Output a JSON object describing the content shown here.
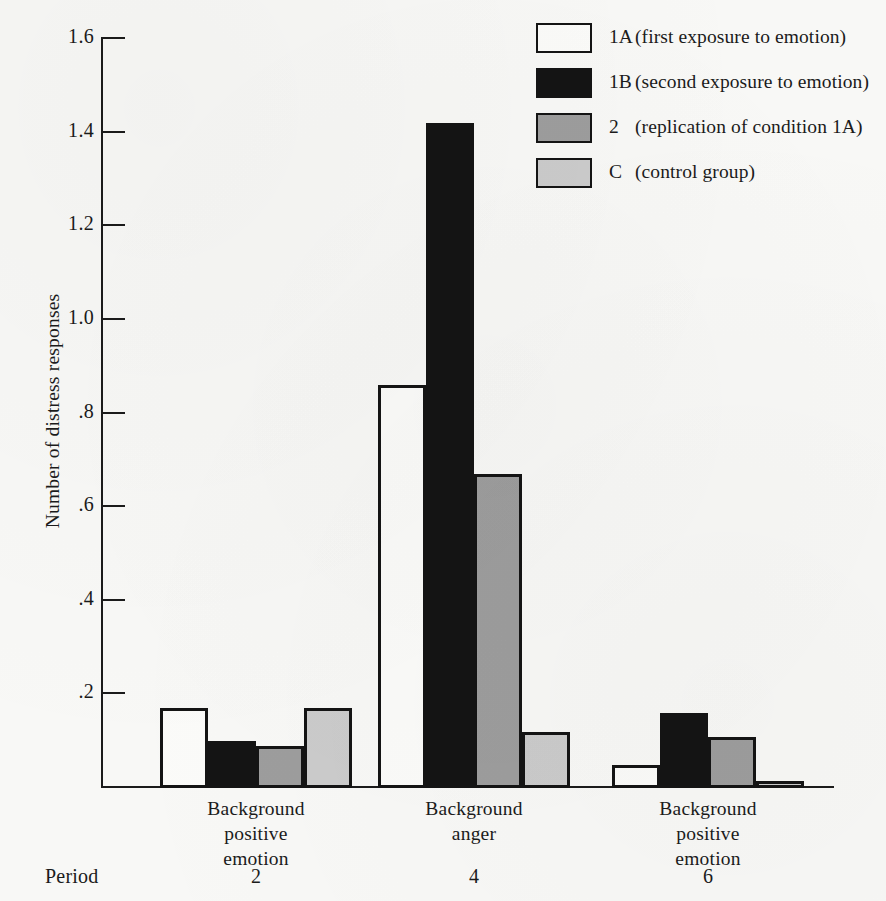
{
  "chart_data": {
    "type": "bar",
    "title": "",
    "xlabel": "",
    "ylabel": "Number of distress responses",
    "ylim": [
      0,
      1.6
    ],
    "ytick_labels": [
      "1.6",
      "1.4",
      "1.2",
      "1.0",
      ".8",
      ".6",
      ".4",
      ".2"
    ],
    "ytick_values": [
      1.6,
      1.4,
      1.2,
      1.0,
      0.8,
      0.6,
      0.4,
      0.2
    ],
    "grid": false,
    "legend_position": "top-right",
    "group_axis_prefix": "Period",
    "categories": [
      {
        "lines": [
          "Background",
          "positive",
          "emotion"
        ],
        "period": "2"
      },
      {
        "lines": [
          "Background",
          "anger"
        ],
        "period": "4"
      },
      {
        "lines": [
          "Background",
          "positive",
          "emotion"
        ],
        "period": "6"
      }
    ],
    "series": [
      {
        "name": "1A",
        "label": "1A (first exposure to emotion)",
        "code": "1A",
        "description": "(first exposure to emotion)",
        "fill": "#fbfbf9",
        "values": [
          0.17,
          0.86,
          0.05
        ]
      },
      {
        "name": "1B",
        "label": "1B (second exposure to emotion)",
        "code": "1B",
        "description": "(second exposure to emotion)",
        "fill": "#141414",
        "values": [
          0.1,
          1.42,
          0.16
        ]
      },
      {
        "name": "2",
        "label": "2 (replication of condition 1A)",
        "code": "2",
        "description": "(replication of condition 1A)",
        "fill": "#9d9d9d",
        "values": [
          0.09,
          0.67,
          0.11
        ]
      },
      {
        "name": "C",
        "label": "C (control group)",
        "code": "C",
        "description": "(control group)",
        "fill": "#cbcbcb",
        "values": [
          0.17,
          0.12,
          0.015
        ]
      }
    ]
  }
}
